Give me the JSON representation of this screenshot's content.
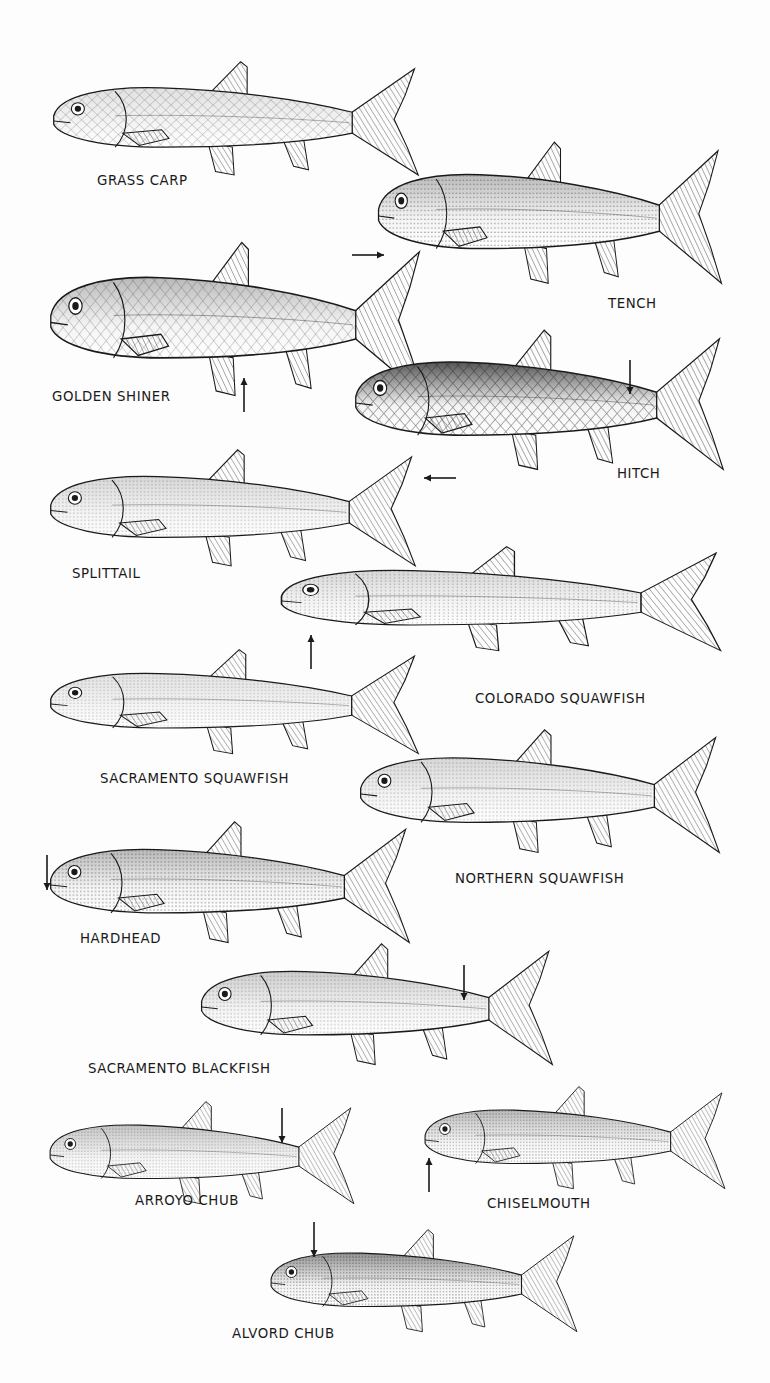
{
  "plate": {
    "background": "#fdfdfd",
    "ink": "#1a1a1a",
    "fish": [
      {
        "id": "grass-carp",
        "label": "GRASS CARP",
        "box": [
          50,
          60,
          372,
          122
        ],
        "label_pos": [
          97,
          172
        ],
        "shade": "scales",
        "tone": 0.15,
        "arrow": null
      },
      {
        "id": "tench",
        "label": "TENCH",
        "box": [
          375,
          140,
          350,
          152
        ],
        "label_pos": [
          608,
          295
        ],
        "shade": "stipple",
        "tone": 0.35,
        "arrow": {
          "dir": "right",
          "x1": 352,
          "y1": 255,
          "x2": 384,
          "y2": 255
        }
      },
      {
        "id": "golden-shiner",
        "label": "GOLDEN SHINER",
        "box": [
          47,
          240,
          380,
          165
        ],
        "label_pos": [
          52,
          388
        ],
        "shade": "scales",
        "tone": 0.35,
        "arrow": {
          "dir": "up",
          "x1": 244,
          "y1": 412,
          "x2": 244,
          "y2": 378
        }
      },
      {
        "id": "hitch",
        "label": "HITCH",
        "box": [
          352,
          328,
          375,
          150
        ],
        "label_pos": [
          617,
          465
        ],
        "shade": "scales-dark",
        "tone": 0.6,
        "arrow": {
          "dir": "down",
          "x1": 630,
          "y1": 360,
          "x2": 630,
          "y2": 394
        }
      },
      {
        "id": "splittail",
        "label": "SPLITTAIL",
        "box": [
          47,
          448,
          372,
          125
        ],
        "label_pos": [
          72,
          565
        ],
        "shade": "stipple",
        "tone": 0.2,
        "arrow": {
          "dir": "left",
          "x1": 456,
          "y1": 478,
          "x2": 424,
          "y2": 478
        }
      },
      {
        "id": "colorado-squawfish",
        "label": "COLORADO SQUAWFISH",
        "box": [
          277,
          545,
          448,
          112
        ],
        "label_pos": [
          475,
          690
        ],
        "shade": "stipple",
        "tone": 0.2,
        "arrow": {
          "dir": "up",
          "x1": 311,
          "y1": 669,
          "x2": 311,
          "y2": 635
        }
      },
      {
        "id": "sacramento-squawfish",
        "label": "SACRAMENTO SQUAWFISH",
        "box": [
          47,
          648,
          375,
          112
        ],
        "label_pos": [
          100,
          770
        ],
        "shade": "stipple",
        "tone": 0.15,
        "arrow": null
      },
      {
        "id": "northern-squawfish",
        "label": "NORTHERN SQUAWFISH",
        "box": [
          357,
          728,
          366,
          132
        ],
        "label_pos": [
          455,
          870
        ],
        "shade": "stipple",
        "tone": 0.2,
        "arrow": null
      },
      {
        "id": "hardhead",
        "label": "HARDHEAD",
        "box": [
          47,
          820,
          366,
          130
        ],
        "label_pos": [
          80,
          930
        ],
        "shade": "stipple",
        "tone": 0.35,
        "arrow": {
          "dir": "down",
          "x1": 47,
          "y1": 855,
          "x2": 47,
          "y2": 890
        }
      },
      {
        "id": "sacramento-blackfish",
        "label": "SACRAMENTO BLACKFISH",
        "box": [
          198,
          942,
          358,
          130
        ],
        "label_pos": [
          88,
          1060
        ],
        "shade": "stipple",
        "tone": 0.25,
        "arrow": {
          "dir": "down",
          "x1": 464,
          "y1": 965,
          "x2": 464,
          "y2": 1000
        }
      },
      {
        "id": "arroyo-chub",
        "label": "ARROYO CHUB",
        "box": [
          47,
          1100,
          310,
          110
        ],
        "label_pos": [
          135,
          1192
        ],
        "shade": "stipple",
        "tone": 0.3,
        "arrow": {
          "dir": "down",
          "x1": 282,
          "y1": 1108,
          "x2": 282,
          "y2": 1143
        }
      },
      {
        "id": "chiselmouth",
        "label": "CHISELMOUTH",
        "box": [
          422,
          1085,
          306,
          110
        ],
        "label_pos": [
          487,
          1195
        ],
        "shade": "stipple",
        "tone": 0.35,
        "arrow": {
          "dir": "up",
          "x1": 429,
          "y1": 1192,
          "x2": 429,
          "y2": 1158
        }
      },
      {
        "id": "alvord-chub",
        "label": "ALVORD CHUB",
        "box": [
          268,
          1228,
          312,
          110
        ],
        "label_pos": [
          232,
          1325
        ],
        "shade": "stipple",
        "tone": 0.55,
        "arrow": {
          "dir": "down",
          "x1": 314,
          "y1": 1222,
          "x2": 314,
          "y2": 1257
        }
      }
    ]
  },
  "labels": {
    "grass_carp": "GRASS CARP",
    "tench": "TENCH",
    "golden_shiner": "GOLDEN SHINER",
    "hitch": "HITCH",
    "splittail": "SPLITTAIL",
    "colorado_squawfish": "COLORADO SQUAWFISH",
    "sacramento_squawfish": "SACRAMENTO SQUAWFISH",
    "northern_squawfish": "NORTHERN SQUAWFISH",
    "hardhead": "HARDHEAD",
    "sacramento_blackfish": "SACRAMENTO BLACKFISH",
    "arroyo_chub": "ARROYO CHUB",
    "chiselmouth": "CHISELMOUTH",
    "alvord_chub": "ALVORD CHUB"
  }
}
